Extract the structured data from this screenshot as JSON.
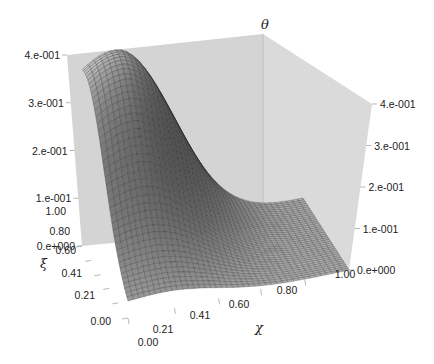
{
  "chart_data": {
    "type": "surface3d",
    "title": "",
    "xlabel": "χ",
    "ylabel": "ξ",
    "zlabel": "θ",
    "x_ticks": [
      "0.00",
      "0.21",
      "0.41",
      "0.60",
      "0.80",
      "1.00"
    ],
    "y_ticks": [
      "0.00",
      "0.21",
      "0.41",
      "0.60",
      "0.80",
      "1.00"
    ],
    "z_ticks_left": [
      "0.e+000",
      "1.e-001",
      "2.e-001",
      "3.e-001",
      "4.e-001"
    ],
    "z_ticks_right": [
      "0.e+000",
      "1.e-001",
      "2.e-001",
      "3.e-001",
      "4.e-001"
    ],
    "xlim": [
      0,
      1
    ],
    "ylim": [
      0,
      1
    ],
    "zlim": [
      0,
      0.4
    ],
    "grid_resolution": 40,
    "surface_description": "Single-peaked dome; peak ~0.40 near χ≈0.15, ξ≈0.95; decays toward χ=1; value ~0.1-0.15 along ξ=0 edge near χ=0",
    "peak": {
      "x": 0.15,
      "y": 0.95,
      "z": 0.4
    },
    "sample_values": [
      {
        "x": 0.0,
        "y": 1.0,
        "z": 0.3
      },
      {
        "x": 0.15,
        "y": 0.95,
        "z": 0.4
      },
      {
        "x": 0.0,
        "y": 0.0,
        "z": 0.12
      },
      {
        "x": 0.5,
        "y": 0.5,
        "z": 0.12
      },
      {
        "x": 1.0,
        "y": 1.0,
        "z": 0.0
      },
      {
        "x": 1.0,
        "y": 0.0,
        "z": 0.0
      }
    ],
    "colors": {
      "surface_dark": "#3a3a3a",
      "surface_light": "#e8e8e8",
      "wall_left": "#d4d4d4",
      "wall_right": "#dadada",
      "mesh": "#2a2a2a"
    }
  }
}
